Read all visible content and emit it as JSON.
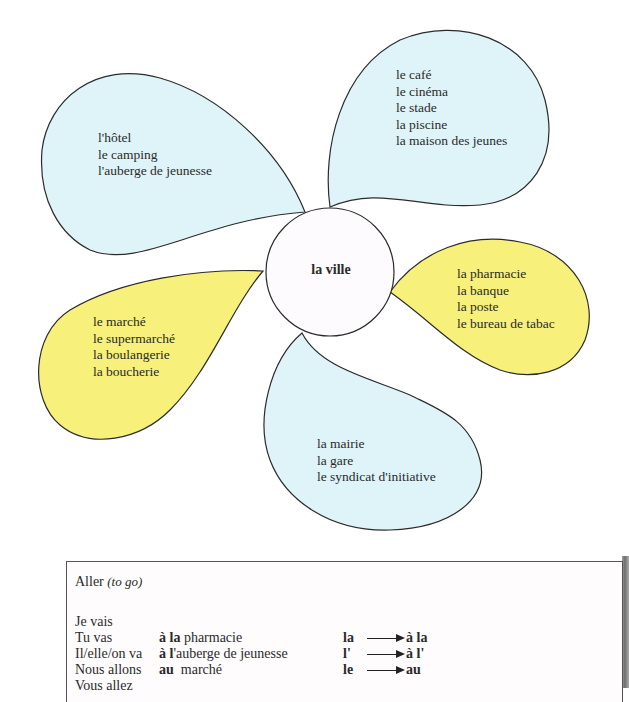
{
  "diagram": {
    "center": {
      "label": "la ville"
    },
    "colors": {
      "blue_petal": "#dff4f8",
      "yellow_petal": "#f7f07a",
      "center_fill": "#fdfbfd",
      "outline": "#2b2b2b"
    },
    "petals": [
      {
        "id": "top-left",
        "color": "blue",
        "items": [
          "l'hôtel",
          "le camping",
          "l'auberge de jeunesse"
        ]
      },
      {
        "id": "top-right",
        "color": "blue",
        "items": [
          "le café",
          "le cinéma",
          "le stade",
          "la piscine",
          "la maison des jeunes"
        ]
      },
      {
        "id": "right",
        "color": "yellow",
        "items": [
          "la pharmacie",
          "la banque",
          "la poste",
          "le bureau de tabac"
        ]
      },
      {
        "id": "left",
        "color": "yellow",
        "items": [
          "le marché",
          "le supermarché",
          "la boulangerie",
          "la boucherie"
        ]
      },
      {
        "id": "bottom",
        "color": "blue",
        "items": [
          "la mairie",
          "la gare",
          "le syndicat d'initiative"
        ]
      }
    ]
  },
  "grammar": {
    "title": "Aller",
    "title_translation": "(to go)",
    "conjugation": [
      "Je vais",
      "Tu vas",
      "Il/elle/on va",
      "Nous allons",
      "Vous allez"
    ],
    "examples": [
      {
        "prep": "à la",
        "noun": " pharmacie"
      },
      {
        "prep": "à l",
        "noun": "'auberge de jeunesse"
      },
      {
        "prep": "au",
        "noun": "  marché"
      }
    ],
    "rules": [
      {
        "from": "la",
        "to": "à la"
      },
      {
        "from": "l'",
        "to": "à l'"
      },
      {
        "from": "le",
        "to": "au"
      }
    ]
  }
}
